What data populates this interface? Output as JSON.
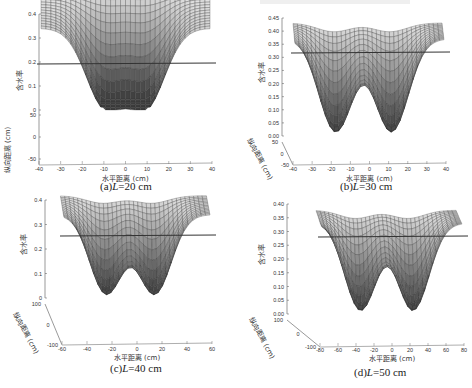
{
  "figure": {
    "panels": [
      {
        "id": "a",
        "caption_prefix": "(a)",
        "caption_var": "L",
        "caption_value": "=20 cm"
      },
      {
        "id": "b",
        "caption_prefix": "(b)",
        "caption_var": "L",
        "caption_value": "=30 cm"
      },
      {
        "id": "c",
        "caption_prefix": "(c)",
        "caption_var": "L",
        "caption_value": "=40 cm"
      },
      {
        "id": "d",
        "caption_prefix": "(d)",
        "caption_var": "L",
        "caption_value": "=50 cm"
      }
    ],
    "labels": {
      "z": "含水率",
      "x": "水平距离 (cm)",
      "y": "纵向距离 (cm)"
    }
  },
  "chart_data": [
    {
      "type": "surface",
      "title": "(a)L=20 cm",
      "xlabel": "水平距离 (cm)",
      "ylabel": "纵向距离 (cm)",
      "zlabel": "含水率",
      "xticks": [
        -40,
        -30,
        -20,
        -10,
        0,
        10,
        20,
        30,
        40
      ],
      "yticks": [
        -50,
        0,
        50
      ],
      "zticks": [
        0,
        0.1,
        0.2,
        0.3,
        0.4
      ],
      "xlim": [
        -40,
        40
      ],
      "ylim": [
        -50,
        50
      ],
      "zlim": [
        0,
        0.4
      ],
      "emitter_positions_x": [
        -10,
        10
      ],
      "surface_max": 0.34,
      "surface_min": 0.0,
      "baseline": 0.2
    },
    {
      "type": "surface",
      "title": "(b)L=30 cm",
      "xlabel": "水平距离 (cm)",
      "ylabel": "纵向距离 (cm)",
      "zlabel": "含水率",
      "xticks": [
        -40,
        -30,
        -20,
        -10,
        0,
        10,
        20,
        30,
        40
      ],
      "yticks": [
        -50,
        0,
        50
      ],
      "zticks": [
        0,
        0.05,
        0.1,
        0.15,
        0.2,
        0.25,
        0.3,
        0.35,
        0.4,
        0.45
      ],
      "xlim": [
        -40,
        40
      ],
      "ylim": [
        -50,
        50
      ],
      "zlim": [
        0,
        0.45
      ],
      "emitter_positions_x": [
        -18,
        12
      ],
      "surface_max": 0.37,
      "surface_min": 0.0,
      "baseline": 0.31
    },
    {
      "type": "surface",
      "title": "(c)L=40 cm",
      "xlabel": "水平距离 (cm)",
      "ylabel": "纵向距离 (cm)",
      "zlabel": "含水率",
      "xticks": [
        -60,
        -40,
        -20,
        0,
        20,
        40,
        60
      ],
      "yticks": [
        -100,
        0,
        100
      ],
      "zticks": [
        0,
        0.1,
        0.2,
        0.3,
        0.4
      ],
      "xlim": [
        -60,
        60
      ],
      "ylim": [
        -100,
        100
      ],
      "zlim": [
        0,
        0.4
      ],
      "emitter_positions_x": [
        -25,
        15
      ],
      "surface_max": 0.34,
      "surface_min": 0.0,
      "baseline": 0.25
    },
    {
      "type": "surface",
      "title": "(d)L=50 cm",
      "xlabel": "水平距离 (cm)",
      "ylabel": "纵向距离 (cm)",
      "zlabel": "含水率",
      "xticks": [
        -80,
        -60,
        -40,
        -20,
        0,
        20,
        40,
        60,
        80
      ],
      "yticks": [
        -100,
        0,
        100
      ],
      "zticks": [
        0,
        0.05,
        0.1,
        0.15,
        0.2,
        0.25,
        0.3,
        0.35,
        0.4
      ],
      "xlim": [
        -80,
        80
      ],
      "ylim": [
        -100,
        100
      ],
      "zlim": [
        0,
        0.4
      ],
      "emitter_positions_x": [
        -35,
        25
      ],
      "surface_max": 0.33,
      "surface_min": 0.0,
      "baseline": 0.27
    }
  ]
}
